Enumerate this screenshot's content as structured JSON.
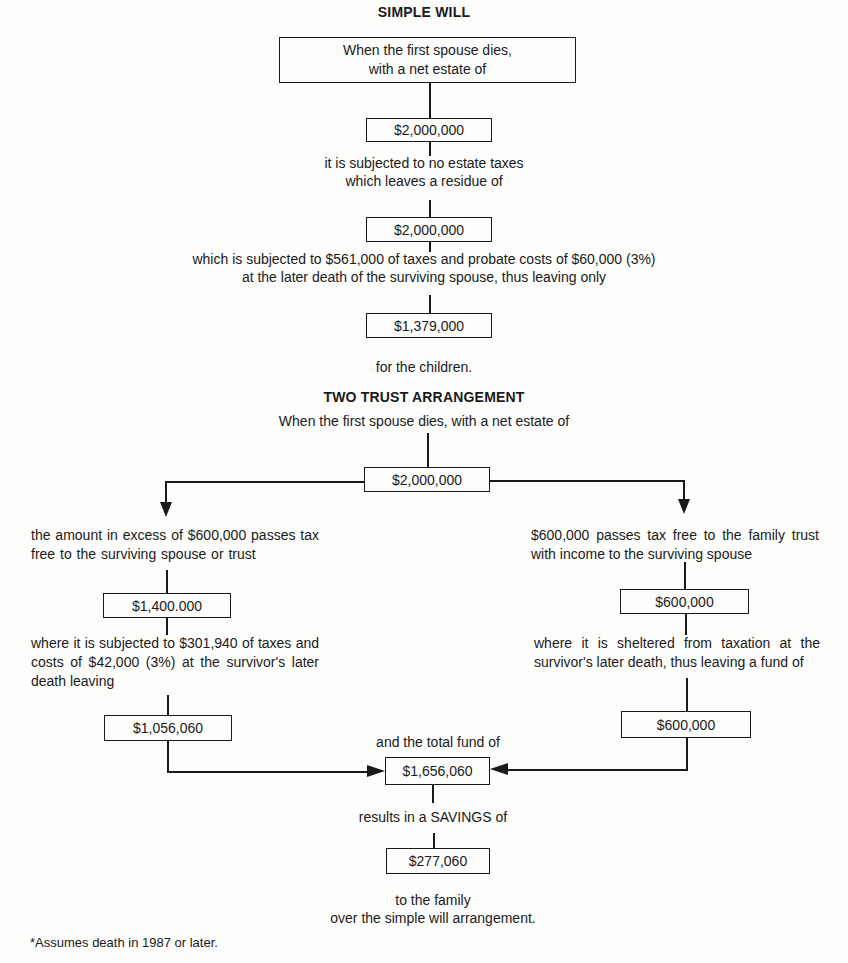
{
  "simple_will": {
    "title": "SIMPLE WILL",
    "start_box": [
      "When the first spouse dies,",
      "with a net estate of"
    ],
    "estate_value": "$2,000,000",
    "step1_text": [
      "it is subjected to no estate taxes",
      "which leaves a residue of"
    ],
    "residue_value": "$2,000,000",
    "step2_text": [
      "which is subjected to $561,000 of taxes and probate costs of $60,000 (3%)",
      "at the later death of the surviving spouse, thus leaving only"
    ],
    "children_value": "$1,379,000",
    "end_text": "for the children."
  },
  "two_trust": {
    "title": "TWO TRUST ARRANGEMENT",
    "intro_text": "When the first spouse dies, with a net estate of",
    "estate_value": "$2,000,000",
    "left_branch": {
      "text1": "the amount in excess of $600,000 passes tax free to the surviving spouse or trust",
      "value1": "$1,400.000",
      "text2": "where it is subjected to $301,940 of taxes and costs of $42,000 (3%) at the survivor's later death leaving",
      "value2": "$1,056,060"
    },
    "right_branch": {
      "text1": "$600,000 passes tax free to the family trust with income to the surviving spouse",
      "value1": "$600,000",
      "text2": "where it is sheltered from taxation at the survivor's later death, thus leaving a fund of",
      "value2": "$600,000"
    },
    "total_text": "and the total fund of",
    "total_value": "$1,656,060",
    "savings_text": "results in a SAVINGS of",
    "savings_value": "$277,060",
    "end_text": [
      "to the family",
      "over the simple will arrangement."
    ]
  },
  "footnote": "*Assumes death in 1987 or later."
}
